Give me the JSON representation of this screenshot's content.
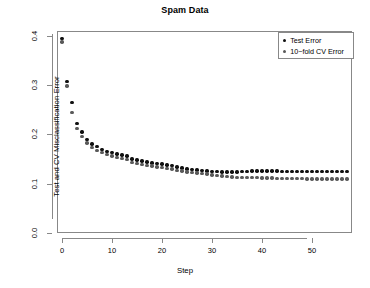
{
  "chart_data": {
    "type": "scatter",
    "title": "Spam Data",
    "xlabel": "Step",
    "ylabel": "Test and CV Misclassification Error",
    "xlim": [
      -1,
      58
    ],
    "ylim": [
      0.0,
      0.41
    ],
    "grid": false,
    "legend_position": "top-right",
    "xticks": [
      0,
      10,
      20,
      30,
      40,
      50
    ],
    "xtick_labels": [
      "0",
      "10",
      "20",
      "30",
      "40",
      "50"
    ],
    "yticks": [
      0.0,
      0.1,
      0.2,
      0.3,
      0.4
    ],
    "ytick_labels": [
      "0.0",
      "0.1",
      "0.2",
      "0.3",
      "0.4"
    ],
    "x": [
      0,
      1,
      2,
      3,
      4,
      5,
      6,
      7,
      8,
      9,
      10,
      11,
      12,
      13,
      14,
      15,
      16,
      17,
      18,
      19,
      20,
      21,
      22,
      23,
      24,
      25,
      26,
      27,
      28,
      29,
      30,
      31,
      32,
      33,
      34,
      35,
      36,
      37,
      38,
      39,
      40,
      41,
      42,
      43,
      44,
      45,
      46,
      47,
      48,
      49,
      50,
      51,
      52,
      53,
      54,
      55,
      56,
      57
    ],
    "series": [
      {
        "name": "Test Error",
        "color": "#101010",
        "marker": "circle",
        "values": [
          0.395,
          0.308,
          0.265,
          0.222,
          0.205,
          0.19,
          0.181,
          0.175,
          0.17,
          0.166,
          0.163,
          0.16,
          0.158,
          0.156,
          0.15,
          0.148,
          0.146,
          0.144,
          0.142,
          0.141,
          0.14,
          0.138,
          0.137,
          0.134,
          0.132,
          0.13,
          0.129,
          0.128,
          0.127,
          0.126,
          0.125,
          0.125,
          0.124,
          0.124,
          0.124,
          0.124,
          0.125,
          0.125,
          0.126,
          0.126,
          0.126,
          0.126,
          0.126,
          0.126,
          0.125,
          0.125,
          0.125,
          0.125,
          0.125,
          0.125,
          0.125,
          0.125,
          0.125,
          0.125,
          0.125,
          0.125,
          0.125,
          0.125
        ]
      },
      {
        "name": "10−fold CV Error",
        "color": "#595959",
        "marker": "circle",
        "values": [
          0.388,
          0.298,
          0.245,
          0.212,
          0.196,
          0.183,
          0.174,
          0.168,
          0.163,
          0.159,
          0.156,
          0.153,
          0.151,
          0.149,
          0.143,
          0.141,
          0.139,
          0.137,
          0.136,
          0.134,
          0.133,
          0.131,
          0.13,
          0.127,
          0.126,
          0.124,
          0.123,
          0.122,
          0.121,
          0.12,
          0.118,
          0.117,
          0.116,
          0.115,
          0.114,
          0.113,
          0.113,
          0.113,
          0.113,
          0.113,
          0.112,
          0.112,
          0.112,
          0.111,
          0.111,
          0.111,
          0.111,
          0.111,
          0.111,
          0.11,
          0.11,
          0.11,
          0.11,
          0.11,
          0.11,
          0.11,
          0.11,
          0.11
        ]
      }
    ]
  },
  "legend": {
    "items": [
      {
        "label": "Test Error"
      },
      {
        "label": "10−fold CV Error"
      }
    ]
  }
}
